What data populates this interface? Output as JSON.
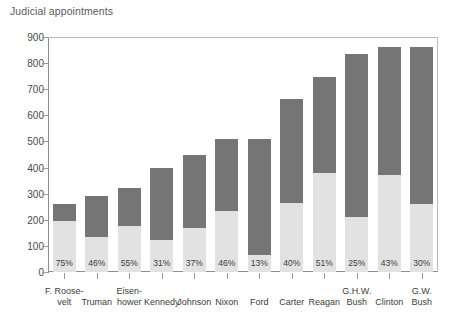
{
  "chart_data": {
    "type": "bar",
    "title": "Judicial appointments",
    "subtitle": "",
    "xlabel": "",
    "ylabel": "",
    "ylim": [
      0,
      900
    ],
    "ytick_step": 100,
    "yticks": [
      "0",
      "100",
      "200",
      "300",
      "400",
      "500",
      "600",
      "700",
      "800",
      "900"
    ],
    "grid": false,
    "legend": "none",
    "stacked": true,
    "categories": [
      "F. Roosevelt",
      "Truman",
      "Eisenhower",
      "Kennedy",
      "Johnson",
      "Nixon",
      "Ford",
      "Carter",
      "Reagan",
      "G.H.W. Bush",
      "Clinton",
      "G.W. Bush"
    ],
    "category_lines": [
      [
        "F. Roose-",
        "velt"
      ],
      [
        "",
        "Truman"
      ],
      [
        "Eisen-",
        "hower"
      ],
      [
        "",
        "Kennedy"
      ],
      [
        "",
        "Johnson"
      ],
      [
        "",
        "Nixon"
      ],
      [
        "",
        "Ford"
      ],
      [
        "",
        "Carter"
      ],
      [
        "",
        "Reagan"
      ],
      [
        "G.H.W.",
        "Bush"
      ],
      [
        "",
        "Clinton"
      ],
      [
        "G.W.",
        "Bush"
      ]
    ],
    "values": [
      260,
      292,
      322,
      398,
      450,
      510,
      509,
      663,
      745,
      835,
      862,
      862
    ],
    "series": [
      {
        "name": "Lower segment (share of appointments)",
        "color": "#e2e2e2",
        "values": [
          195,
          134,
          177,
          123,
          167,
          235,
          66,
          265,
          380,
          209,
          371,
          259
        ]
      },
      {
        "name": "Upper segment",
        "color": "#757575",
        "values": [
          65,
          158,
          145,
          275,
          283,
          275,
          443,
          398,
          365,
          626,
          491,
          603
        ]
      }
    ],
    "percent_labels": [
      "75%",
      "46%",
      "55%",
      "31%",
      "37%",
      "46%",
      "13%",
      "40%",
      "51%",
      "25%",
      "43%",
      "30%"
    ],
    "percentages": [
      75,
      46,
      55,
      31,
      37,
      46,
      13,
      40,
      51,
      25,
      43,
      30
    ]
  },
  "colors": {
    "bar_upper": "#757575",
    "bar_lower": "#e2e2e2",
    "axis": "#8d8d8d",
    "frame": "#b9b9b9",
    "text": "#3d3d3d",
    "title": "#5a5a5a",
    "background": "#ffffff"
  }
}
